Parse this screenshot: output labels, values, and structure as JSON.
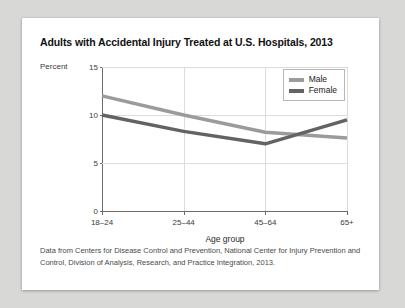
{
  "chart_data": {
    "type": "line",
    "title": "Adults with Accidental Injury Treated at U.S. Hospitals, 2013",
    "xlabel": "Age group",
    "ylabel": "Percent",
    "categories": [
      "18–24",
      "25–44",
      "45–64",
      "65+"
    ],
    "series": [
      {
        "name": "Male",
        "values": [
          12.0,
          10.0,
          8.2,
          7.6
        ],
        "color": "#9b9b9b"
      },
      {
        "name": "Female",
        "values": [
          10.0,
          8.3,
          7.0,
          9.5
        ],
        "color": "#636363"
      }
    ],
    "ylim": [
      0,
      15
    ],
    "yticks": [
      0,
      5,
      10,
      15
    ],
    "ytick_labels": [
      "0",
      "5",
      "10",
      "15"
    ],
    "grid": true,
    "legend_position": "top-right",
    "footnote": "Data from Centers for Disease Control and Prevention, National Center for Injury Prevention and Control, Division of Analysis, Research, and Practice Integration, 2013."
  },
  "colors": {
    "male_line": "#9b9b9b",
    "female_line": "#636363",
    "gridline": "#dcdcdc",
    "axis": "#6b6b6b",
    "card_background": "#ffffff",
    "page_background": "#d8d8d6"
  }
}
